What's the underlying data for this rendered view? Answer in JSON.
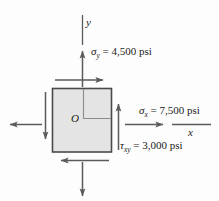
{
  "figure": {
    "type": "plane-stress-element",
    "background_color": "#fdfdfd",
    "element_fill_color": "#e4e4e4",
    "stroke_color": "#5a5a5a",
    "text_color": "#1a1a1a"
  },
  "axes": {
    "y_label": "y",
    "x_label": "x"
  },
  "origin": {
    "label": "O"
  },
  "stresses": {
    "sigma_y": {
      "symbol": "σ",
      "subscript": "y",
      "equals": "=",
      "value": "4,500",
      "unit": "psi",
      "full": "σy = 4,500 psi"
    },
    "sigma_x": {
      "symbol": "σ",
      "subscript": "x",
      "equals": "=",
      "value": "7,500",
      "unit": "psi",
      "full": "σx = 7,500 psi"
    },
    "tau_xy": {
      "symbol": "τ",
      "subscript": "xy",
      "equals": "=",
      "value": "3,000",
      "unit": "psi",
      "full": "τxy = 3,000 psi"
    }
  }
}
